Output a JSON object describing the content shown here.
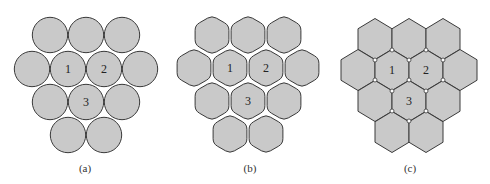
{
  "figure": {
    "colors": {
      "cell_fill": "#c9c9c9",
      "cell_stroke": "#3a3a3a",
      "node_fill": "#ffffff",
      "node_stroke": "#3a3a3a",
      "background": "#ffffff"
    },
    "panels": [
      {
        "id": "a",
        "caption": "(a)",
        "caption_pos": [
          85,
          168
        ],
        "shape": "circle",
        "radius": 18,
        "cells": [
          {
            "cx": 50,
            "cy": 35,
            "label": ""
          },
          {
            "cx": 86,
            "cy": 35,
            "label": ""
          },
          {
            "cx": 122,
            "cy": 35,
            "label": ""
          },
          {
            "cx": 32,
            "cy": 69,
            "label": ""
          },
          {
            "cx": 68,
            "cy": 69,
            "label": "1"
          },
          {
            "cx": 104,
            "cy": 69,
            "label": "2"
          },
          {
            "cx": 140,
            "cy": 69,
            "label": ""
          },
          {
            "cx": 50,
            "cy": 102,
            "label": ""
          },
          {
            "cx": 86,
            "cy": 102,
            "label": "3"
          },
          {
            "cx": 122,
            "cy": 102,
            "label": ""
          },
          {
            "cx": 68,
            "cy": 135,
            "label": ""
          },
          {
            "cx": 104,
            "cy": 135,
            "label": ""
          }
        ],
        "nodes": []
      },
      {
        "id": "b",
        "caption": "(b)",
        "caption_pos": [
          250,
          168
        ],
        "shape": "rounded-hexagon",
        "half_width": 17.5,
        "radius": 20,
        "cells": [
          {
            "cx": 212,
            "cy": 35,
            "label": ""
          },
          {
            "cx": 248,
            "cy": 35,
            "label": ""
          },
          {
            "cx": 284,
            "cy": 35,
            "label": ""
          },
          {
            "cx": 194,
            "cy": 68,
            "label": ""
          },
          {
            "cx": 230,
            "cy": 68,
            "label": "1"
          },
          {
            "cx": 266,
            "cy": 68,
            "label": "2"
          },
          {
            "cx": 302,
            "cy": 68,
            "label": ""
          },
          {
            "cx": 212,
            "cy": 101,
            "label": ""
          },
          {
            "cx": 248,
            "cy": 101,
            "label": "3"
          },
          {
            "cx": 284,
            "cy": 101,
            "label": ""
          },
          {
            "cx": 230,
            "cy": 134,
            "label": ""
          },
          {
            "cx": 266,
            "cy": 134,
            "label": ""
          }
        ],
        "nodes": []
      },
      {
        "id": "c",
        "caption": "(c)",
        "caption_pos": [
          410,
          168
        ],
        "shape": "hexagon",
        "half_width": 17,
        "radius": 20.5,
        "cells": [
          {
            "cx": 375,
            "cy": 39,
            "label": ""
          },
          {
            "cx": 409,
            "cy": 39,
            "label": ""
          },
          {
            "cx": 443,
            "cy": 39,
            "label": ""
          },
          {
            "cx": 358,
            "cy": 70,
            "label": ""
          },
          {
            "cx": 392,
            "cy": 70,
            "label": "1"
          },
          {
            "cx": 426,
            "cy": 70,
            "label": "2"
          },
          {
            "cx": 460,
            "cy": 70,
            "label": ""
          },
          {
            "cx": 375,
            "cy": 101,
            "label": ""
          },
          {
            "cx": 409,
            "cy": 101,
            "label": "3"
          },
          {
            "cx": 443,
            "cy": 101,
            "label": ""
          },
          {
            "cx": 392,
            "cy": 132,
            "label": ""
          },
          {
            "cx": 426,
            "cy": 132,
            "label": ""
          }
        ],
        "nodes": [
          [
            392,
            50
          ],
          [
            426,
            50
          ],
          [
            375,
            60
          ],
          [
            409,
            60
          ],
          [
            443,
            60
          ],
          [
            375,
            80
          ],
          [
            409,
            80
          ],
          [
            443,
            80
          ],
          [
            392,
            91
          ],
          [
            426,
            91
          ],
          [
            392,
            111
          ],
          [
            426,
            111
          ],
          [
            409,
            121
          ]
        ]
      }
    ]
  }
}
